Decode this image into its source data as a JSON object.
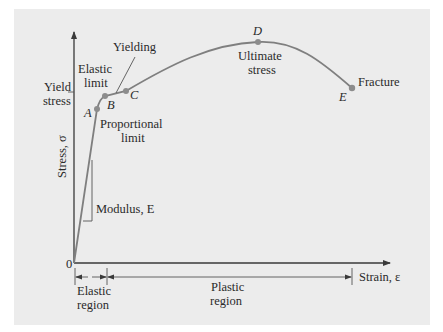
{
  "diagram": {
    "axes": {
      "y_label": "Stress, σ",
      "x_label": "Strain, ε",
      "origin_label": "0",
      "yield_stress_label_line1": "Yield",
      "yield_stress_label_line2": "stress"
    },
    "points": [
      {
        "id": "A",
        "label": "A",
        "description_line1": "Proportional",
        "description_line2": "limit"
      },
      {
        "id": "B",
        "label": "B",
        "description_line1": "Elastic",
        "description_line2": "limit"
      },
      {
        "id": "C",
        "label": "C",
        "description_line1": "Yielding",
        "description_line2": ""
      },
      {
        "id": "D",
        "label": "D",
        "description_line1": "Ultimate",
        "description_line2": "stress"
      },
      {
        "id": "E",
        "label": "E",
        "description_line1": "Fracture",
        "description_line2": ""
      }
    ],
    "modulus_label": "Modulus, E",
    "regions": [
      {
        "line1": "Elastic",
        "line2": "region"
      },
      {
        "line1": "Plastic",
        "line2": "region"
      }
    ],
    "colors": {
      "background": "#ececec",
      "curve": "#7f7f7f",
      "axis": "#3a3a3a",
      "text": "#2a2a2a"
    }
  }
}
